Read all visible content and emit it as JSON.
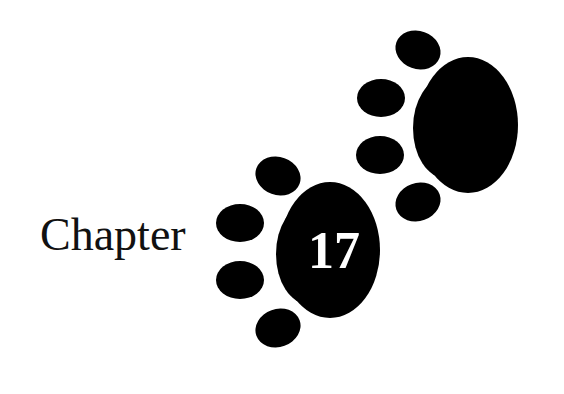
{
  "chapter": {
    "label": "Chapter",
    "number": "17"
  },
  "decorations": {
    "icon": "paw-print-icon",
    "count": 2,
    "color": "#000000"
  }
}
